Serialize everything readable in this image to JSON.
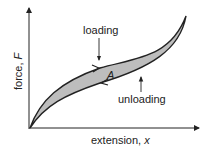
{
  "diagram": {
    "type": "hysteresis-loop",
    "labels": {
      "loading": "loading",
      "unloading": "unloading",
      "area": "A",
      "y_axis": "force, ",
      "y_axis_var": "F",
      "x_axis": "extension, ",
      "x_axis_var": "x"
    },
    "colors": {
      "fill": "#bdbdbd",
      "stroke": "#222222",
      "background": "#ffffff"
    }
  }
}
